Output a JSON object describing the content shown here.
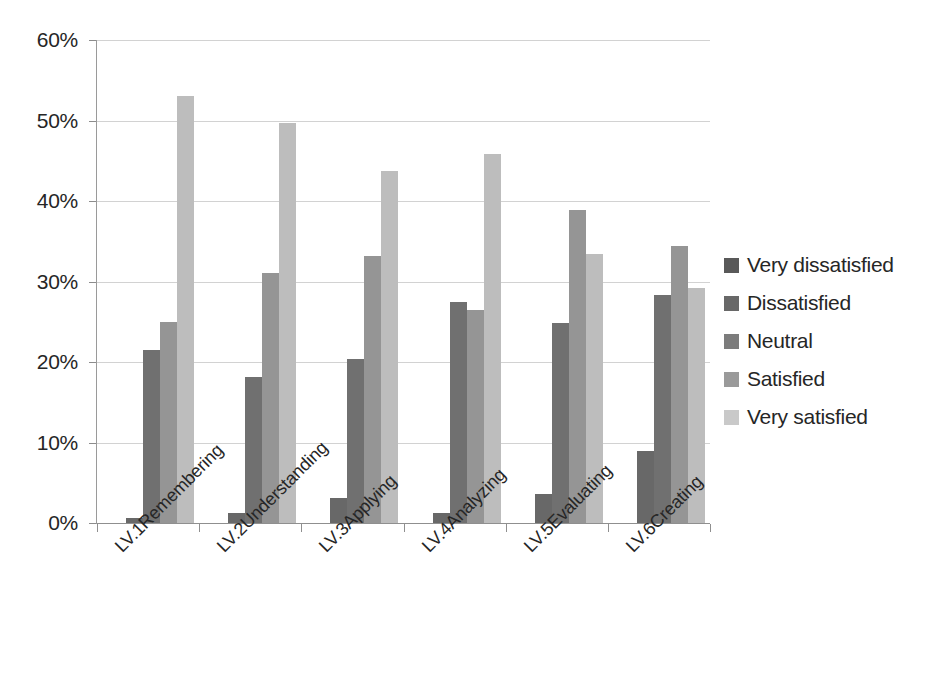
{
  "chart_data": {
    "type": "bar",
    "title": "",
    "subtitle": "",
    "xlabel": "",
    "ylabel": "",
    "grid": true,
    "legend_position": "right",
    "ylim": [
      0,
      60
    ],
    "y_tick_labels": [
      "0%",
      "10%",
      "20%",
      "30%",
      "40%",
      "50%",
      "60%"
    ],
    "y_tick_values": [
      0,
      10,
      20,
      30,
      40,
      50,
      60
    ],
    "categories": [
      "LV.1Remembering",
      "LV.2Understanding",
      "LV.3Applying",
      "LV.4Analyzing",
      "LV.5Evaluating",
      "LV.6Creating"
    ],
    "series": [
      {
        "name": "Very dissatisfied",
        "color": "#595959",
        "values": [
          0,
          0,
          0,
          0,
          0,
          0
        ]
      },
      {
        "name": "Dissatisfied",
        "color": "#686868",
        "values": [
          0.6,
          1.3,
          3.1,
          1.2,
          3.6,
          9.0
        ]
      },
      {
        "name": "Neutral",
        "color": "#707070",
        "values": [
          21.5,
          18.2,
          20.4,
          27.5,
          24.8,
          28.3
        ]
      },
      {
        "name": "Satisfied",
        "color": "#959595",
        "values": [
          25.0,
          31.0,
          33.2,
          26.5,
          38.9,
          34.4
        ]
      },
      {
        "name": "Very satisfied",
        "color": "#bdbdbd",
        "values": [
          53.0,
          49.7,
          43.7,
          45.8,
          33.4,
          29.2
        ]
      }
    ],
    "legend_entries": [
      {
        "label": "Very dissatisfied",
        "color": "#595959"
      },
      {
        "label": "Dissatisfied",
        "color": "#686868"
      },
      {
        "label": "Neutral",
        "color": "#7c7c7c"
      },
      {
        "label": "Satisfied",
        "color": "#9a9a9a"
      },
      {
        "label": "Very satisfied",
        "color": "#c9c9c9"
      }
    ]
  }
}
